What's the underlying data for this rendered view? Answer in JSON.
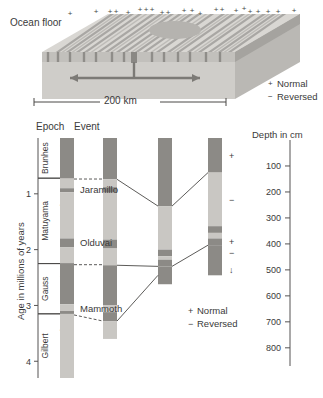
{
  "block_diagram": {
    "ocean_floor_label": "Ocean floor",
    "scale_label": "200 km",
    "legend": [
      {
        "symbol": "+",
        "label": "Normal"
      },
      {
        "symbol": "−",
        "label": "Reversed"
      }
    ],
    "plus_marks_top": 22,
    "colors": {
      "top_surface_light": "#d8d6d2",
      "top_surface_dark": "#a9a7a4",
      "front_face": "#cdcbc7",
      "side_face": "#b9b7b3",
      "crust_band": "#a3a19d",
      "arrow": "#7a7874"
    }
  },
  "chart": {
    "axis_y_title": "Age in millions of years",
    "axis_y_ticks": [
      "1",
      "2",
      "3",
      "4"
    ],
    "axis_y_values": [
      1,
      2,
      3,
      4
    ],
    "axis_y_range": [
      0,
      4.3
    ],
    "depth_axis_title": "Depth in cm",
    "depth_ticks": [
      "100",
      "200",
      "300",
      "400",
      "500",
      "600",
      "700",
      "800"
    ],
    "depth_values": [
      100,
      200,
      300,
      400,
      500,
      600,
      700,
      800
    ],
    "column_headers": [
      "Epoch",
      "Event"
    ],
    "epochs": [
      {
        "name": "Brunhes",
        "polarity": "normal",
        "top_ma": 0.0,
        "bottom_ma": 0.72
      },
      {
        "name": "Matuyama",
        "polarity": "reversed",
        "top_ma": 0.72,
        "bottom_ma": 2.25
      },
      {
        "name": "Gauss",
        "polarity": "normal",
        "top_ma": 2.25,
        "bottom_ma": 3.15
      },
      {
        "name": "Gilbert",
        "polarity": "reversed",
        "top_ma": 3.15,
        "bottom_ma": 4.3
      }
    ],
    "events": [
      {
        "name": "Jaramillo",
        "ma": 0.93
      },
      {
        "name": "Olduvai",
        "ma": 1.88
      },
      {
        "name": "Mammoth",
        "ma": 3.06
      }
    ],
    "legend": [
      {
        "symbol": "+",
        "label": "Normal"
      },
      {
        "symbol": "−",
        "label": "Reversed"
      }
    ],
    "core_annotations": [
      "+",
      "−",
      "+",
      "−",
      "↓"
    ],
    "colors": {
      "normal_dark": "#8c8a86",
      "reversed_light": "#c9c7c3",
      "event_band": "#8c8a86",
      "axis": "#555353",
      "text": "#3a3a3a",
      "connector": "#4a4846"
    },
    "columns": [
      {
        "id": "timescale-column",
        "bands": [
          {
            "top_ma": 0.0,
            "bottom_ma": 0.72,
            "polarity": "normal"
          },
          {
            "top_ma": 0.72,
            "bottom_ma": 0.9,
            "polarity": "reversed"
          },
          {
            "top_ma": 0.9,
            "bottom_ma": 0.97,
            "polarity": "normal"
          },
          {
            "top_ma": 0.97,
            "bottom_ma": 1.8,
            "polarity": "reversed"
          },
          {
            "top_ma": 1.8,
            "bottom_ma": 1.96,
            "polarity": "normal"
          },
          {
            "top_ma": 1.96,
            "bottom_ma": 2.25,
            "polarity": "reversed"
          },
          {
            "top_ma": 2.25,
            "bottom_ma": 2.98,
            "polarity": "normal"
          },
          {
            "top_ma": 2.98,
            "bottom_ma": 3.1,
            "polarity": "reversed"
          },
          {
            "top_ma": 3.1,
            "bottom_ma": 3.15,
            "polarity": "normal"
          },
          {
            "top_ma": 3.15,
            "bottom_ma": 4.3,
            "polarity": "reversed"
          }
        ]
      },
      {
        "id": "core-column-1",
        "bands": [
          {
            "top_ma": 0.0,
            "bottom_ma": 0.74,
            "polarity": "normal"
          },
          {
            "top_ma": 0.74,
            "bottom_ma": 0.88,
            "polarity": "reversed"
          },
          {
            "top_ma": 0.88,
            "bottom_ma": 0.98,
            "polarity": "normal"
          },
          {
            "top_ma": 0.98,
            "bottom_ma": 1.82,
            "polarity": "reversed"
          },
          {
            "top_ma": 1.82,
            "bottom_ma": 1.98,
            "polarity": "normal"
          },
          {
            "top_ma": 1.98,
            "bottom_ma": 2.28,
            "polarity": "reversed"
          },
          {
            "top_ma": 2.28,
            "bottom_ma": 3.0,
            "polarity": "normal"
          },
          {
            "top_ma": 3.0,
            "bottom_ma": 3.12,
            "polarity": "reversed"
          },
          {
            "top_ma": 3.12,
            "bottom_ma": 3.28,
            "polarity": "normal"
          },
          {
            "top_ma": 3.28,
            "bottom_ma": 3.6,
            "polarity": "reversed"
          }
        ]
      },
      {
        "id": "core-column-2",
        "bands": [
          {
            "top_ma": 0.0,
            "bottom_ma": 1.22,
            "polarity": "normal"
          },
          {
            "top_ma": 1.22,
            "bottom_ma": 2.0,
            "polarity": "reversed"
          },
          {
            "top_ma": 2.0,
            "bottom_ma": 2.12,
            "polarity": "normal"
          },
          {
            "top_ma": 2.12,
            "bottom_ma": 2.18,
            "polarity": "reversed"
          },
          {
            "top_ma": 2.18,
            "bottom_ma": 2.3,
            "polarity": "normal"
          },
          {
            "top_ma": 2.3,
            "bottom_ma": 2.62,
            "polarity": "normal"
          }
        ]
      },
      {
        "id": "core-column-3",
        "bands": [
          {
            "top_ma": 0.0,
            "bottom_ma": 0.62,
            "polarity": "normal"
          },
          {
            "top_ma": 0.62,
            "bottom_ma": 1.58,
            "polarity": "reversed"
          },
          {
            "top_ma": 1.58,
            "bottom_ma": 1.7,
            "polarity": "normal"
          },
          {
            "top_ma": 1.7,
            "bottom_ma": 1.8,
            "polarity": "reversed"
          },
          {
            "top_ma": 1.8,
            "bottom_ma": 1.92,
            "polarity": "normal"
          },
          {
            "top_ma": 1.92,
            "bottom_ma": 2.46,
            "polarity": "normal"
          }
        ]
      }
    ]
  }
}
